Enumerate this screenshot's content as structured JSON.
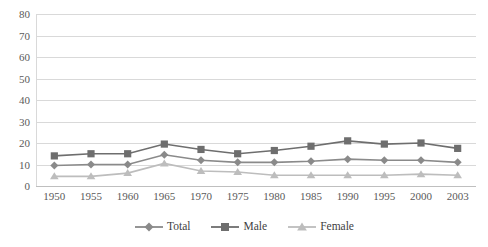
{
  "chart_data": {
    "type": "line",
    "title": "",
    "subtitle": "",
    "xlabel": "",
    "ylabel": "",
    "categories": [
      "1950",
      "1955",
      "1960",
      "1965",
      "1970",
      "1975",
      "1980",
      "1985",
      "1990",
      "1995",
      "2000",
      "2003"
    ],
    "ylim": [
      0,
      80
    ],
    "ytick_step": 10,
    "yticks": [
      "0",
      "10",
      "20",
      "30",
      "40",
      "50",
      "60",
      "70",
      "80"
    ],
    "grid": true,
    "legend_position": "bottom",
    "series": [
      {
        "name": "Total",
        "marker": "diamond",
        "color": "#8a8a8a",
        "values": [
          9.5,
          10,
          10,
          14.5,
          12,
          11,
          11,
          11.5,
          12.5,
          12,
          12,
          11
        ]
      },
      {
        "name": "Male",
        "marker": "square",
        "color": "#6e6e6e",
        "values": [
          14,
          15,
          15,
          19.5,
          17,
          15,
          16.5,
          18.5,
          21,
          19.5,
          20,
          17.5
        ]
      },
      {
        "name": "Female",
        "marker": "triangle",
        "color": "#bdbdbd",
        "values": [
          4.5,
          4.5,
          6,
          10.5,
          7,
          6.5,
          5,
          5,
          5,
          5,
          5.5,
          5
        ]
      }
    ]
  },
  "colors": {
    "grid": "#d9d9d9",
    "axis": "#bfbfbf",
    "tick_text": "#5a5a5a",
    "legend_text": "#3f3f3f",
    "background": "#ffffff"
  }
}
